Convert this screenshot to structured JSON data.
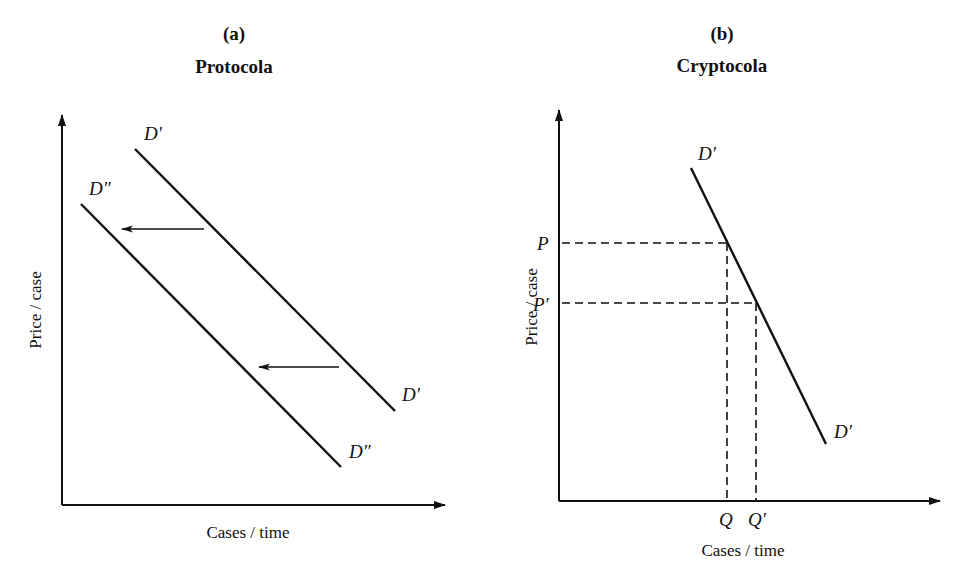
{
  "panels": [
    {
      "id": "a",
      "label": "(a)",
      "title": "Protocola",
      "ylabel": "Price / case",
      "xlabel": "Cases / time",
      "curves": [
        {
          "name": "D'",
          "label_start": "D′",
          "label_end": "D′"
        },
        {
          "name": "D''",
          "label_start": "D″",
          "label_end": "D″"
        }
      ],
      "annotation": "Leftward shift arrows from D' to D''"
    },
    {
      "id": "b",
      "label": "(b)",
      "title": "Cryptocola",
      "ylabel": "Price / case",
      "xlabel": "Cases / time",
      "curves": [
        {
          "name": "D'",
          "label_start": "D′",
          "label_end": "D′"
        }
      ],
      "price_ticks": [
        "P",
        "P′"
      ],
      "quantity_ticks": [
        "Q",
        "Q′"
      ]
    }
  ]
}
